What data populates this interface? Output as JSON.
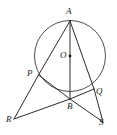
{
  "figure": {
    "width": 117,
    "height": 135,
    "background_color": "#ffffff",
    "stroke_color": "#2b2b2b",
    "circle_color": "#3a3a3a"
  },
  "labels": {
    "a": "A",
    "o": "O",
    "p": "P",
    "b": "B",
    "q": "Q",
    "r": "R",
    "s": "S"
  },
  "geometry": {
    "circle": {
      "cx": 70,
      "cy": 56,
      "r": 35.5
    },
    "points": {
      "A": {
        "x": 70,
        "y": 21
      },
      "O": {
        "x": 70,
        "y": 56
      },
      "P": {
        "x": 38.5,
        "y": 75
      },
      "B": {
        "x": 70,
        "y": 99
      },
      "Q": {
        "x": 94,
        "y": 89
      },
      "R": {
        "x": 14,
        "y": 119
      },
      "S": {
        "x": 103,
        "y": 122
      }
    },
    "segments": [
      {
        "name": "A-B",
        "from": "A",
        "to": "B"
      },
      {
        "name": "A-P",
        "from": "A",
        "to": "P"
      },
      {
        "name": "P-R",
        "from": "P",
        "to": "R"
      },
      {
        "name": "A-Q",
        "from": "A",
        "to": "Q"
      },
      {
        "name": "Q-S",
        "from": "Q",
        "to": "S"
      },
      {
        "name": "R-B",
        "from": "R",
        "to": "B"
      },
      {
        "name": "B-S",
        "from": "B",
        "to": "S"
      },
      {
        "name": "P-B",
        "from": "P",
        "to": "B"
      },
      {
        "name": "B-Q",
        "from": "B",
        "to": "Q"
      }
    ]
  },
  "label_positions": {
    "a": {
      "x": 66,
      "y": 7
    },
    "o": {
      "x": 60,
      "y": 51
    },
    "p": {
      "x": 27,
      "y": 69
    },
    "b": {
      "x": 67,
      "y": 102
    },
    "q": {
      "x": 96,
      "y": 87
    },
    "r": {
      "x": 6,
      "y": 115
    },
    "s": {
      "x": 99,
      "y": 118
    }
  }
}
